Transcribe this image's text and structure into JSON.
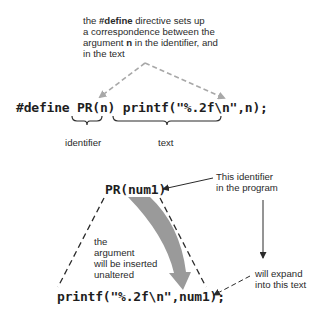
{
  "top_note": {
    "line1_prefix": "the ",
    "line1_bold": "#define",
    "line1_suffix": " directive sets up",
    "line2": "a correspondence between the",
    "line3_prefix": "argument ",
    "line3_bold": "n",
    "line3_suffix": " in the identifier, and",
    "line4": "in the text"
  },
  "define_line": {
    "keyword": "#define",
    "identifier": "PR(n)",
    "text": "printf(\"%.2f\\n\",n);"
  },
  "brace_labels": {
    "identifier": "identifier",
    "text": "text"
  },
  "usage": {
    "call": "PR(num1)",
    "expansion": "printf(\"%.2f\\n\",num1);"
  },
  "callouts": {
    "identifier_note_line1": "This identifier",
    "identifier_note_line2": "in the program",
    "expand_note_line1": "will expand",
    "expand_note_line2": "into this text",
    "argument_note_line1": "the",
    "argument_note_line2": "argument",
    "argument_note_line3": "will be inserted",
    "argument_note_line4": "unaltered"
  },
  "colors": {
    "text": "#2a2a2a",
    "dashed_gray": "#a8a8a8",
    "curved_arrow": "#9a9a9a",
    "dark_lines": "#2a2a2a"
  }
}
